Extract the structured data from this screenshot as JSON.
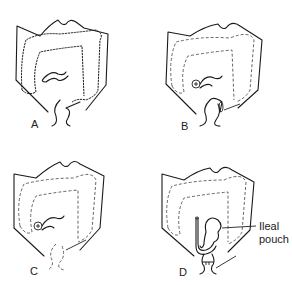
{
  "figure": {
    "panels": [
      {
        "id": "A",
        "label": "A",
        "description": "Intact colon (solid outline)"
      },
      {
        "id": "B",
        "label": "B",
        "description": "Colon removed (dashed), ileostomy, rectal stump"
      },
      {
        "id": "C",
        "label": "C",
        "description": "Colon and rectum removed (dashed), ileostomy"
      },
      {
        "id": "D",
        "label": "D",
        "description": "Ileal pouch joined to anus"
      }
    ],
    "annotations": {
      "pouch_label_line1": "Ileal",
      "pouch_label_line2": "pouch"
    }
  }
}
